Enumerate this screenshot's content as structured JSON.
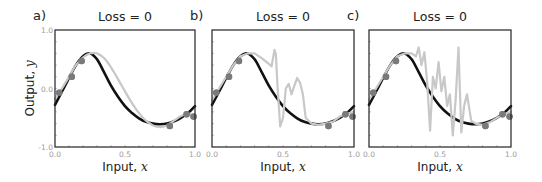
{
  "figure": {
    "panels": [
      {
        "label": "a)",
        "title": "Loss = 0"
      },
      {
        "label": "b)",
        "title": "Loss = 0"
      },
      {
        "label": "c)",
        "title": "Loss = 0"
      }
    ],
    "xlabel_text": "Input, ",
    "xlabel_var": "x",
    "ylabel_text": "Output, ",
    "ylabel_var": "y",
    "xticks": [
      "0.0",
      "0.5",
      "1.0"
    ],
    "yticks": [
      "1.0",
      "0.0",
      "-1.0"
    ]
  },
  "colors": {
    "true_function": "#111111",
    "fitted_model": "#c8c8c8",
    "data_points": "#7a7a7a",
    "axes": "#222222"
  },
  "chart_data": [
    {
      "type": "line",
      "panel": "a",
      "title": "Loss = 0",
      "xlabel": "Input, x",
      "ylabel": "Output, y",
      "xlim": [
        0.0,
        1.0
      ],
      "ylim": [
        -1.0,
        1.0
      ],
      "xticks": [
        0.0,
        0.5,
        1.0
      ],
      "yticks": [
        -1.0,
        0.0,
        1.0
      ],
      "grid": false,
      "series": [
        {
          "name": "true function",
          "color": "#111111",
          "x": [
            0.0,
            0.05,
            0.1,
            0.15,
            0.2,
            0.25,
            0.3,
            0.35,
            0.4,
            0.45,
            0.5,
            0.55,
            0.6,
            0.65,
            0.7,
            0.75,
            0.8,
            0.85,
            0.9,
            0.95,
            1.0
          ],
          "y": [
            -0.28,
            -0.05,
            0.18,
            0.4,
            0.55,
            0.6,
            0.5,
            0.28,
            0.05,
            -0.14,
            -0.3,
            -0.42,
            -0.51,
            -0.57,
            -0.6,
            -0.61,
            -0.6,
            -0.56,
            -0.5,
            -0.42,
            -0.3
          ]
        },
        {
          "name": "fitted model (smooth)",
          "color": "#c8c8c8",
          "x": [
            0.0,
            0.05,
            0.1,
            0.15,
            0.2,
            0.25,
            0.3,
            0.35,
            0.4,
            0.45,
            0.5,
            0.55,
            0.6,
            0.65,
            0.7,
            0.75,
            0.8,
            0.85,
            0.9,
            0.95,
            1.0
          ],
          "y": [
            -0.18,
            0.0,
            0.2,
            0.4,
            0.53,
            0.6,
            0.6,
            0.52,
            0.36,
            0.16,
            -0.05,
            -0.25,
            -0.42,
            -0.55,
            -0.63,
            -0.66,
            -0.63,
            -0.55,
            -0.47,
            -0.44,
            -0.45
          ]
        },
        {
          "name": "training data",
          "type": "scatter",
          "color": "#7a7a7a",
          "x": [
            0.03,
            0.12,
            0.19,
            0.82,
            0.94,
            0.99
          ],
          "y": [
            -0.07,
            0.2,
            0.47,
            -0.64,
            -0.44,
            -0.48
          ]
        }
      ]
    },
    {
      "type": "line",
      "panel": "b",
      "title": "Loss = 0",
      "xlabel": "Input, x",
      "ylabel": "Output, y",
      "xlim": [
        0.0,
        1.0
      ],
      "ylim": [
        -1.0,
        1.0
      ],
      "xticks": [
        0.0,
        0.5,
        1.0
      ],
      "grid": false,
      "series": [
        {
          "name": "true function",
          "color": "#111111",
          "x": [
            0.0,
            0.05,
            0.1,
            0.15,
            0.2,
            0.25,
            0.3,
            0.35,
            0.4,
            0.45,
            0.5,
            0.55,
            0.6,
            0.65,
            0.7,
            0.75,
            0.8,
            0.85,
            0.9,
            0.95,
            1.0
          ],
          "y": [
            -0.28,
            -0.05,
            0.18,
            0.4,
            0.55,
            0.6,
            0.5,
            0.28,
            0.05,
            -0.14,
            -0.3,
            -0.42,
            -0.51,
            -0.57,
            -0.6,
            -0.61,
            -0.6,
            -0.56,
            -0.5,
            -0.42,
            -0.3
          ]
        },
        {
          "name": "fitted model (overfit)",
          "color": "#c8c8c8",
          "x": [
            0.0,
            0.05,
            0.1,
            0.15,
            0.2,
            0.25,
            0.3,
            0.35,
            0.4,
            0.42,
            0.44,
            0.45,
            0.46,
            0.48,
            0.5,
            0.52,
            0.54,
            0.56,
            0.58,
            0.6,
            0.62,
            0.64,
            0.66,
            0.7,
            0.75,
            0.8,
            0.85,
            0.9,
            0.95,
            1.0
          ],
          "y": [
            -0.2,
            0.0,
            0.2,
            0.4,
            0.55,
            0.6,
            0.6,
            0.52,
            0.42,
            0.38,
            0.66,
            0.58,
            0.1,
            -0.65,
            -0.5,
            0.0,
            0.08,
            -0.1,
            0.05,
            0.18,
            0.1,
            -0.1,
            -0.5,
            -0.6,
            -0.62,
            -0.6,
            -0.57,
            -0.48,
            -0.43,
            -0.4
          ]
        },
        {
          "name": "training data",
          "type": "scatter",
          "color": "#7a7a7a",
          "x": [
            0.03,
            0.12,
            0.19,
            0.82,
            0.94,
            0.99
          ],
          "y": [
            -0.07,
            0.2,
            0.47,
            -0.64,
            -0.44,
            -0.48
          ]
        }
      ]
    },
    {
      "type": "line",
      "panel": "c",
      "title": "Loss = 0",
      "xlabel": "Input, x",
      "ylabel": "Output, y",
      "xlim": [
        0.0,
        1.0
      ],
      "ylim": [
        -1.0,
        1.0
      ],
      "xticks": [
        0.0,
        0.5,
        1.0
      ],
      "grid": false,
      "series": [
        {
          "name": "true function",
          "color": "#111111",
          "x": [
            0.0,
            0.05,
            0.1,
            0.15,
            0.2,
            0.25,
            0.3,
            0.35,
            0.4,
            0.45,
            0.5,
            0.55,
            0.6,
            0.65,
            0.7,
            0.75,
            0.8,
            0.85,
            0.9,
            0.95,
            1.0
          ],
          "y": [
            -0.28,
            -0.05,
            0.18,
            0.4,
            0.55,
            0.6,
            0.5,
            0.28,
            0.05,
            -0.14,
            -0.3,
            -0.42,
            -0.51,
            -0.57,
            -0.6,
            -0.61,
            -0.6,
            -0.56,
            -0.5,
            -0.42,
            -0.3
          ]
        },
        {
          "name": "fitted model (very overfit)",
          "color": "#c8c8c8",
          "x": [
            0.0,
            0.05,
            0.1,
            0.15,
            0.2,
            0.25,
            0.3,
            0.33,
            0.35,
            0.37,
            0.39,
            0.41,
            0.43,
            0.45,
            0.47,
            0.49,
            0.51,
            0.53,
            0.55,
            0.57,
            0.59,
            0.61,
            0.63,
            0.65,
            0.67,
            0.69,
            0.72,
            0.75,
            0.8,
            0.85,
            0.9,
            0.95,
            1.0
          ],
          "y": [
            -0.2,
            0.0,
            0.2,
            0.4,
            0.55,
            0.6,
            0.6,
            0.55,
            0.7,
            0.4,
            0.62,
            0.1,
            -0.72,
            0.2,
            0.0,
            0.45,
            -0.05,
            0.2,
            -0.3,
            -0.1,
            -0.8,
            -0.2,
            0.7,
            -0.75,
            -0.3,
            -0.1,
            -0.55,
            -0.6,
            -0.62,
            -0.58,
            -0.5,
            -0.44,
            -0.4
          ]
        },
        {
          "name": "training data",
          "type": "scatter",
          "color": "#7a7a7a",
          "x": [
            0.03,
            0.12,
            0.19,
            0.82,
            0.94,
            0.99
          ],
          "y": [
            -0.07,
            0.2,
            0.47,
            -0.64,
            -0.44,
            -0.48
          ]
        }
      ]
    }
  ]
}
